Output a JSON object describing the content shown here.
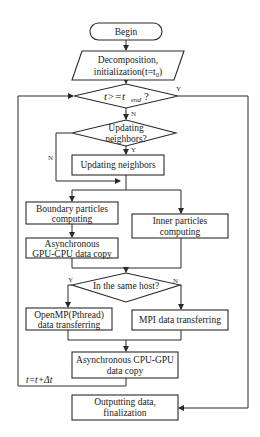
{
  "flowchart": {
    "nodes": {
      "begin": {
        "label": "Begin",
        "shape": "terminator"
      },
      "init": {
        "line1": "Decomposition,",
        "line2": "initialization(t=t₀)",
        "shape": "parallelogram"
      },
      "time_check": {
        "label": "t>=t_end?",
        "main": "t>=t",
        "sub": "end",
        "q": "?",
        "shape": "decision"
      },
      "update_check": {
        "line1": "Updating",
        "line2": "neighbors?",
        "shape": "decision"
      },
      "update": {
        "label": "Updating neighbors",
        "shape": "process"
      },
      "boundary": {
        "line1": "Boundary  particles",
        "line2": "computing",
        "shape": "process"
      },
      "async_gpu_cpu": {
        "line1": "Asynchronous",
        "line2": "GPU-CPU data copy",
        "shape": "process"
      },
      "inner": {
        "line1": "Inner particles",
        "line2": "computing",
        "shape": "process"
      },
      "same_host": {
        "label": "In the same host?",
        "shape": "decision"
      },
      "openmp": {
        "line1": "OpenMP(Pthread)",
        "line2": "data transferring",
        "shape": "process"
      },
      "mpi": {
        "label": "MPI data transferring",
        "shape": "process"
      },
      "async_cpu_gpu": {
        "line1": "Asynchronous CPU-GPU",
        "line2": "data copy",
        "shape": "process"
      },
      "output": {
        "line1": "Outputting data,",
        "line2": "finalization",
        "shape": "process"
      }
    },
    "edge_labels": {
      "time_yes": "Y",
      "time_no": "N",
      "update_yes": "Y",
      "update_no": "N",
      "host_yes": "Y",
      "host_no": "N",
      "loop": "t=t+Δt"
    },
    "colors": {
      "stroke": "#2a2a2a",
      "fill": "#ffffff",
      "text": "#1a1a1a"
    }
  }
}
